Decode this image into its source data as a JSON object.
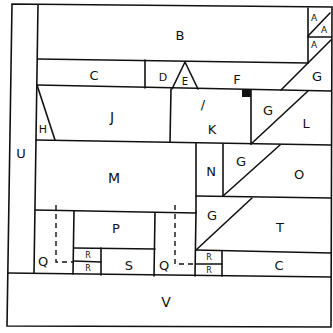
{
  "diagram": {
    "title": "",
    "regions": [
      {
        "id": "region-b",
        "label": "B",
        "x": 180,
        "y": 35,
        "size": 13
      },
      {
        "id": "region-a1",
        "label": "A",
        "x": 314,
        "y": 18,
        "size": 9
      },
      {
        "id": "region-a2",
        "label": "A",
        "x": 324,
        "y": 30,
        "size": 9
      },
      {
        "id": "region-a3",
        "label": "A",
        "x": 314,
        "y": 45,
        "size": 9
      },
      {
        "id": "region-c-top",
        "label": "C",
        "x": 94,
        "y": 75,
        "size": 13
      },
      {
        "id": "region-d",
        "label": "D",
        "x": 163,
        "y": 77,
        "size": 11
      },
      {
        "id": "region-e",
        "label": "E",
        "x": 185,
        "y": 81,
        "size": 10
      },
      {
        "id": "region-f",
        "label": "F",
        "x": 237,
        "y": 79,
        "size": 13
      },
      {
        "id": "region-g1",
        "label": "G",
        "x": 317,
        "y": 76,
        "size": 13
      },
      {
        "id": "region-j",
        "label": "J",
        "x": 112,
        "y": 117,
        "size": 14
      },
      {
        "id": "region-h",
        "label": "H",
        "x": 43,
        "y": 129,
        "size": 11
      },
      {
        "id": "region-i",
        "label": "/",
        "x": 203,
        "y": 104,
        "size": 13
      },
      {
        "id": "region-k",
        "label": "K",
        "x": 212,
        "y": 129,
        "size": 13
      },
      {
        "id": "region-g2",
        "label": "G",
        "x": 268,
        "y": 110,
        "size": 13
      },
      {
        "id": "region-l",
        "label": "L",
        "x": 306,
        "y": 123,
        "size": 13
      },
      {
        "id": "region-u",
        "label": "U",
        "x": 21,
        "y": 153,
        "size": 13
      },
      {
        "id": "region-m",
        "label": "M",
        "x": 114,
        "y": 178,
        "size": 14
      },
      {
        "id": "region-n",
        "label": "N",
        "x": 211,
        "y": 171,
        "size": 13
      },
      {
        "id": "region-g3",
        "label": "G",
        "x": 241,
        "y": 161,
        "size": 13
      },
      {
        "id": "region-o",
        "label": "O",
        "x": 299,
        "y": 174,
        "size": 13
      },
      {
        "id": "region-g4",
        "label": "G",
        "x": 212,
        "y": 215,
        "size": 13
      },
      {
        "id": "region-t",
        "label": "T",
        "x": 280,
        "y": 227,
        "size": 13
      },
      {
        "id": "region-p",
        "label": "P",
        "x": 116,
        "y": 228,
        "size": 13
      },
      {
        "id": "region-q1",
        "label": "Q",
        "x": 43,
        "y": 261,
        "size": 13
      },
      {
        "id": "region-r1",
        "label": "R",
        "x": 88,
        "y": 255,
        "size": 8
      },
      {
        "id": "region-r2",
        "label": "R",
        "x": 88,
        "y": 268,
        "size": 8
      },
      {
        "id": "region-s",
        "label": "S",
        "x": 129,
        "y": 265,
        "size": 13
      },
      {
        "id": "region-q2",
        "label": "Q",
        "x": 164,
        "y": 265,
        "size": 13
      },
      {
        "id": "region-r3",
        "label": "R",
        "x": 209,
        "y": 257,
        "size": 8
      },
      {
        "id": "region-r4",
        "label": "R",
        "x": 209,
        "y": 270,
        "size": 8
      },
      {
        "id": "region-c-bottom",
        "label": "C",
        "x": 279,
        "y": 265,
        "size": 13
      },
      {
        "id": "region-v",
        "label": "V",
        "x": 166,
        "y": 302,
        "size": 14
      }
    ]
  }
}
